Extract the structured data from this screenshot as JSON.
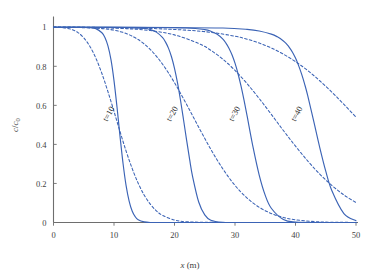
{
  "chart_data": {
    "type": "line",
    "title": "",
    "xlabel": "x (m)",
    "ylabel": "c/c0",
    "ylabel_num": "c",
    "ylabel_den": "c",
    "ylabel_den_sub": "0",
    "xlabel_var": "x",
    "xlabel_unit": "(m)",
    "xlim": [
      0,
      50
    ],
    "ylim": [
      0,
      1.05
    ],
    "xticks": [
      0,
      10,
      20,
      30,
      40,
      50
    ],
    "xticklabels": [
      "0",
      "10",
      "20",
      "30",
      "40",
      "50"
    ],
    "yticks": [
      0,
      0.2,
      0.4,
      0.6,
      0.8,
      1
    ],
    "yticklabels": [
      "0",
      "0.2",
      "0.4",
      "0.6",
      "0.8",
      "1"
    ],
    "grid": false,
    "legend": "none",
    "line_color": "#3b63b5",
    "axis_color": "#6e6e6e",
    "annotations": [
      {
        "text": "t=10",
        "x": 9.5,
        "y": 0.55
      },
      {
        "text": "t=20",
        "x": 20.0,
        "y": 0.55
      },
      {
        "text": "t=30",
        "x": 30.3,
        "y": 0.55
      },
      {
        "text": "t=40",
        "x": 40.6,
        "y": 0.55
      }
    ],
    "series": [
      {
        "name": "t=10 solid",
        "style": "solid",
        "front_center": 10.6,
        "dispersivity": 1.05,
        "points_x": [
          0,
          1,
          2,
          3,
          4,
          5,
          6,
          7,
          8,
          8.5,
          9,
          9.5,
          10,
          10.5,
          11,
          11.5,
          12,
          12.5,
          13,
          13.5,
          14,
          15,
          16,
          18,
          20,
          25,
          30,
          35,
          40,
          45,
          50
        ],
        "points_y": [
          1.0,
          1.0,
          1.0,
          1.0,
          1.0,
          0.999,
          0.998,
          0.993,
          0.972,
          0.948,
          0.905,
          0.834,
          0.727,
          0.59,
          0.44,
          0.301,
          0.189,
          0.11,
          0.059,
          0.03,
          0.014,
          0.003,
          0.0,
          0.0,
          0.0,
          0.0,
          0.0,
          0.0,
          0.0,
          0.0,
          0.0
        ]
      },
      {
        "name": "t=10 dashed",
        "style": "dashed",
        "front_center": 10.6,
        "dispersivity": 2.6,
        "points_x": [
          0,
          1,
          2,
          3,
          4,
          5,
          6,
          7,
          8,
          9,
          10,
          11,
          12,
          13,
          14,
          15,
          16,
          17,
          18,
          20,
          22,
          25,
          30,
          35,
          40,
          45,
          50
        ],
        "points_y": [
          1.0,
          0.999,
          0.996,
          0.989,
          0.974,
          0.946,
          0.903,
          0.842,
          0.763,
          0.67,
          0.569,
          0.465,
          0.366,
          0.277,
          0.201,
          0.14,
          0.094,
          0.06,
          0.037,
          0.013,
          0.004,
          0.001,
          0.0,
          0.0,
          0.0,
          0.0,
          0.0
        ]
      },
      {
        "name": "t=20 solid",
        "style": "solid",
        "front_center": 20.6,
        "dispersivity": 1.4,
        "points_x": [
          0,
          4,
          8,
          12,
          15,
          16,
          17,
          18,
          18.5,
          19,
          19.5,
          20,
          20.5,
          21,
          21.5,
          22,
          22.5,
          23,
          24,
          25,
          26,
          28,
          30,
          35,
          40,
          45,
          50
        ],
        "points_y": [
          1.0,
          1.0,
          1.0,
          0.999,
          0.994,
          0.988,
          0.975,
          0.948,
          0.925,
          0.893,
          0.849,
          0.79,
          0.715,
          0.625,
          0.525,
          0.422,
          0.323,
          0.234,
          0.105,
          0.039,
          0.012,
          0.001,
          0.0,
          0.0,
          0.0,
          0.0,
          0.0
        ]
      },
      {
        "name": "t=20 dashed",
        "style": "dashed",
        "front_center": 20.6,
        "dispersivity": 3.7,
        "points_x": [
          0,
          4,
          8,
          10,
          12,
          14,
          16,
          18,
          20,
          22,
          24,
          26,
          28,
          30,
          32,
          34,
          36,
          38,
          40,
          44,
          48,
          50
        ],
        "points_y": [
          1.0,
          0.999,
          0.993,
          0.985,
          0.968,
          0.937,
          0.886,
          0.812,
          0.716,
          0.605,
          0.488,
          0.375,
          0.274,
          0.19,
          0.125,
          0.078,
          0.046,
          0.026,
          0.014,
          0.003,
          0.001,
          0.0
        ]
      },
      {
        "name": "t=30 solid",
        "style": "solid",
        "front_center": 30.6,
        "dispersivity": 1.75,
        "points_x": [
          0,
          8,
          16,
          22,
          25,
          26,
          27,
          28,
          28.5,
          29,
          29.5,
          30,
          30.5,
          31,
          31.5,
          32,
          33,
          34,
          35,
          36,
          38,
          40,
          45,
          50
        ],
        "points_y": [
          1.0,
          1.0,
          0.999,
          0.996,
          0.988,
          0.98,
          0.965,
          0.939,
          0.919,
          0.893,
          0.859,
          0.816,
          0.762,
          0.698,
          0.625,
          0.546,
          0.383,
          0.243,
          0.139,
          0.073,
          0.015,
          0.002,
          0.0,
          0.0
        ]
      },
      {
        "name": "t=30 dashed",
        "style": "dashed",
        "front_center": 30.6,
        "dispersivity": 4.6,
        "points_x": [
          0,
          6,
          12,
          16,
          20,
          24,
          26,
          28,
          30,
          32,
          34,
          36,
          38,
          40,
          42,
          44,
          46,
          48,
          50
        ],
        "points_y": [
          1.0,
          0.999,
          0.993,
          0.983,
          0.961,
          0.917,
          0.882,
          0.836,
          0.779,
          0.711,
          0.635,
          0.554,
          0.471,
          0.391,
          0.316,
          0.248,
          0.19,
          0.141,
          0.102
        ]
      },
      {
        "name": "t=40 solid",
        "style": "solid",
        "front_center": 40.6,
        "dispersivity": 2.1,
        "points_x": [
          0,
          10,
          20,
          28,
          32,
          34,
          36,
          37,
          38,
          38.5,
          39,
          39.5,
          40,
          40.5,
          41,
          41.5,
          42,
          43,
          44,
          45,
          46,
          48,
          50
        ],
        "points_y": [
          1.0,
          1.0,
          0.999,
          0.996,
          0.989,
          0.981,
          0.965,
          0.951,
          0.93,
          0.915,
          0.896,
          0.872,
          0.842,
          0.805,
          0.761,
          0.71,
          0.652,
          0.52,
          0.385,
          0.263,
          0.164,
          0.046,
          0.009
        ]
      },
      {
        "name": "t=40 dashed",
        "style": "dashed",
        "front_center": 40.6,
        "dispersivity": 5.4,
        "points_x": [
          0,
          8,
          16,
          22,
          26,
          30,
          32,
          34,
          36,
          38,
          40,
          42,
          44,
          46,
          48,
          50
        ],
        "points_y": [
          1.0,
          0.999,
          0.994,
          0.985,
          0.974,
          0.954,
          0.939,
          0.919,
          0.894,
          0.862,
          0.824,
          0.779,
          0.726,
          0.668,
          0.605,
          0.54
        ]
      }
    ]
  },
  "figure": {
    "background": "#ffffff"
  }
}
